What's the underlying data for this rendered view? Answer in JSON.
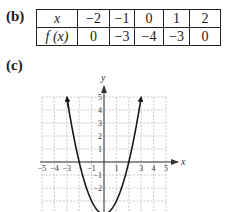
{
  "part_b": {
    "label": "(b)",
    "row_headers": [
      "x",
      "f (x)"
    ],
    "x_values": [
      "−2",
      "−1",
      "0",
      "1",
      "2"
    ],
    "fx_values": [
      "0",
      "−3",
      "−4",
      "−3",
      "0"
    ]
  },
  "part_c": {
    "label": "(c)"
  },
  "chart_data": {
    "type": "line",
    "title": "",
    "function": "f(x) = x^2 - 4",
    "xlabel": "x",
    "ylabel": "y",
    "xlim": [
      -5,
      5
    ],
    "ylim": [
      -4,
      5
    ],
    "grid": true,
    "x_tick_labels": [
      "−5",
      "−4",
      "−3",
      "−1",
      "1",
      "3",
      "4",
      "5"
    ],
    "x_tick_values": [
      -5,
      -4,
      -3,
      -1,
      1,
      3,
      4,
      5
    ],
    "y_tick_labels": [
      "5",
      "4",
      "3",
      "2",
      "1",
      "−1",
      "−2"
    ],
    "y_tick_values": [
      5,
      4,
      3,
      2,
      1,
      -1,
      -2
    ],
    "series": [
      {
        "name": "f(x)",
        "x": [
          -3,
          -2.5,
          -2,
          -1.5,
          -1,
          -0.5,
          0,
          0.5,
          1,
          1.5,
          2,
          2.5,
          3
        ],
        "y": [
          5,
          2.25,
          0,
          -1.75,
          -3,
          -3.75,
          -4,
          -3.75,
          -3,
          -1.75,
          0,
          2.25,
          5
        ],
        "arrows_at_ends": true
      }
    ]
  }
}
